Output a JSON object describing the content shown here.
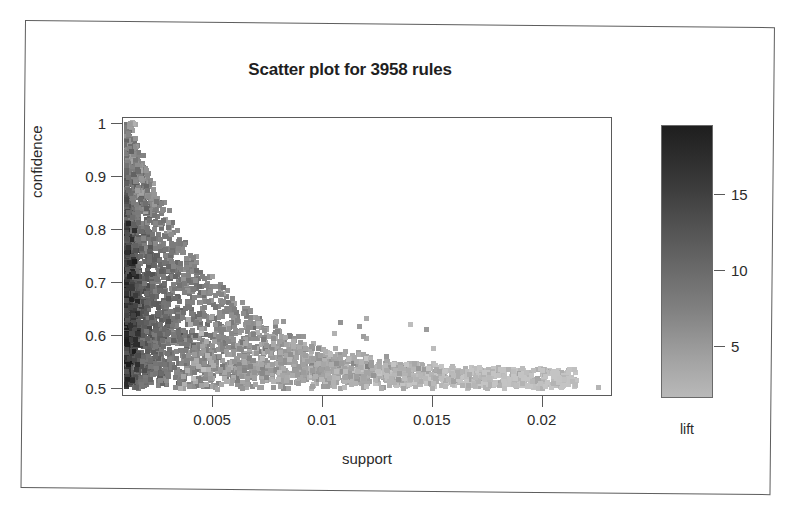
{
  "figure": {
    "title": "Scatter plot for 3958 rules",
    "background": "#ffffff",
    "frame_color": "#5a5a5a"
  },
  "chart_data": {
    "type": "scatter",
    "title": "Scatter plot for 3958 rules",
    "xlabel": "support",
    "ylabel": "confidence",
    "n_rules": 3958,
    "xlim": [
      0.0009,
      0.0232
    ],
    "ylim": [
      0.485,
      1.012
    ],
    "grid": false,
    "xticks": [
      0.005,
      0.01,
      0.015,
      0.02
    ],
    "xtick_labels": [
      "0.005",
      "0.01",
      "0.015",
      "0.02"
    ],
    "yticks": [
      0.5,
      0.6,
      0.7,
      0.8,
      0.9,
      1
    ],
    "ytick_labels": [
      "0.5",
      "0.6",
      "0.7",
      "0.8",
      "0.9",
      "1"
    ],
    "colorbar": {
      "label": "lift",
      "ticks": [
        5,
        10,
        15
      ],
      "tick_labels": [
        "5",
        "10",
        "15"
      ],
      "vmin": 1.6,
      "vmax": 19.5,
      "high_color": "#1e1e1e",
      "low_color": "#b9b9b9",
      "orientation": "vertical"
    },
    "marker": "square",
    "marker_size_px": 5,
    "series_name": "rules",
    "point_color_field": "lift"
  },
  "axes": {
    "x": {
      "label": "support",
      "ticks": [
        "0.005",
        "0.01",
        "0.015",
        "0.02"
      ]
    },
    "y": {
      "label": "confidence",
      "ticks": [
        "1",
        "0.9",
        "0.8",
        "0.7",
        "0.6",
        "0.5"
      ]
    }
  },
  "legend": {
    "label": "lift",
    "ticks": [
      "15",
      "10",
      "5"
    ]
  }
}
